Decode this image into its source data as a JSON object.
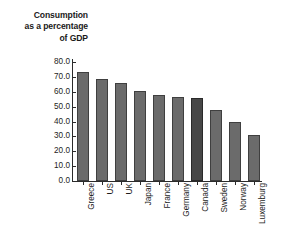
{
  "chart_data": {
    "type": "bar",
    "title": "Consumption as a percentage of GDP",
    "title_lines": [
      "Consumption",
      "as a percentage",
      "of GDP"
    ],
    "categories": [
      "Greece",
      "US",
      "UK",
      "Japan",
      "France",
      "Germany",
      "Canada",
      "Sweden",
      "Norway",
      "Luxemburg"
    ],
    "values": [
      73.0,
      68.5,
      66.0,
      60.5,
      57.5,
      56.5,
      56.0,
      48.0,
      40.0,
      31.0
    ],
    "highlight_category": "Canada",
    "xlabel": "",
    "ylabel": "Consumption as a percentage of GDP",
    "ylim": [
      0.0,
      80.0
    ],
    "ytick_step": 10.0,
    "ytick_labels": [
      "80.0",
      "70.0",
      "60.0",
      "50.0",
      "40.0",
      "30.0",
      "20.0",
      "10.0",
      "0.0"
    ],
    "ytick_values": [
      80.0,
      70.0,
      60.0,
      50.0,
      40.0,
      30.0,
      20.0,
      10.0,
      0.0
    ],
    "grid": false,
    "legend": null,
    "bar_color": "#6b6b6b",
    "bar_highlight_color": "#474747",
    "bar_edge_color": "#3f3f3f",
    "axis_color": "#2b2b2b",
    "background_color": "#ffffff",
    "xlabel_rotation": 90
  }
}
